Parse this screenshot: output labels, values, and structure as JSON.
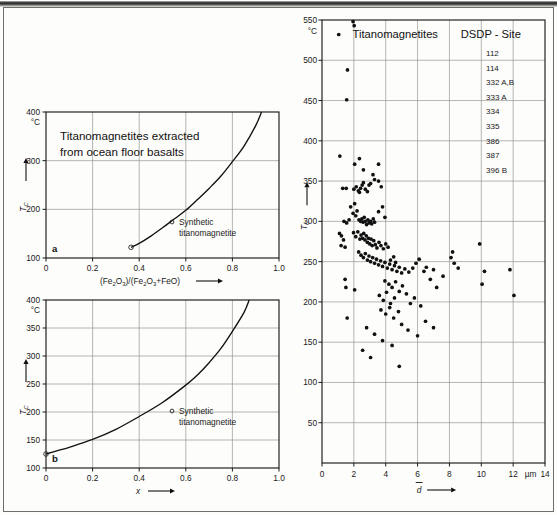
{
  "figure": {
    "background": "#fdfdfb",
    "ink": "#111111",
    "grid_color": "#8e8e8a"
  },
  "panel_a": {
    "label": "a",
    "title_line1": "Titanomagnetites extracted",
    "title_line2": "from ocean floor basalts",
    "ylabel_symbol": "T",
    "ylabel_sub": "C",
    "yunit": "°C",
    "xlabel": "(Fe₂O₃)/(Fe₂O₃+FeO)",
    "legend_marker": "open-circle",
    "legend_line1": "Synthetic",
    "legend_line2": "titanomagnetite",
    "xticks": [
      "0",
      "0.2",
      "0.4",
      "0.6",
      "0.8",
      "1.0"
    ],
    "yticks": [
      "100",
      "200",
      "300",
      "400"
    ]
  },
  "panel_b": {
    "label": "b",
    "ylabel_symbol": "T",
    "ylabel_sub": "C",
    "yunit": "°C",
    "xlabel": "x",
    "legend_marker": "open-circle",
    "legend_line1": "Synthetic",
    "legend_line2": "titanomagnetite",
    "xticks": [
      "0",
      "0.2",
      "0.4",
      "0.6",
      "0.8",
      "1.0"
    ],
    "yticks": [
      "100",
      "150",
      "200",
      "250",
      "300",
      "350",
      "400"
    ]
  },
  "panel_c": {
    "title": "Titanomagnetites",
    "legend_title": "DSDP - Site",
    "sites": [
      "112",
      "114",
      "332 A,B",
      "333 A",
      "334",
      "335",
      "386",
      "387",
      "396 B"
    ],
    "ylabel_symbol": "T",
    "ylabel_sub": "C",
    "yunit": "°C",
    "xlabel": "d",
    "xunit": "µm",
    "xticks": [
      "0",
      "2",
      "4",
      "6",
      "8",
      "10",
      "12",
      "14"
    ],
    "yticks": [
      "50",
      "100",
      "150",
      "200",
      "250",
      "300",
      "350",
      "400",
      "450",
      "500",
      "550"
    ]
  },
  "chart_data": [
    {
      "type": "line",
      "panel": "a",
      "title": "Titanomagnetites extracted from ocean floor basalts",
      "xlabel": "(Fe2O3)/(Fe2O3+FeO)",
      "ylabel": "Tc (°C)",
      "xlim": [
        0,
        1.0
      ],
      "ylim": [
        100,
        400
      ],
      "grid": true,
      "series": [
        {
          "name": "Synthetic titanomagnetite",
          "marker": "open-circle-start",
          "x": [
            0.365,
            0.4,
            0.45,
            0.5,
            0.55,
            0.6,
            0.65,
            0.7,
            0.75,
            0.8,
            0.85,
            0.9,
            0.925
          ],
          "y": [
            122,
            130,
            145,
            162,
            180,
            198,
            220,
            243,
            268,
            298,
            330,
            372,
            400
          ]
        }
      ]
    },
    {
      "type": "line",
      "panel": "b",
      "xlabel": "x",
      "ylabel": "Tc (°C)",
      "xlim": [
        0,
        1.0
      ],
      "ylim": [
        100,
        400
      ],
      "grid": true,
      "series": [
        {
          "name": "Synthetic titanomagnetite",
          "marker": "open-circle-start",
          "x": [
            0.0,
            0.05,
            0.1,
            0.2,
            0.3,
            0.4,
            0.5,
            0.6,
            0.65,
            0.7,
            0.75,
            0.8,
            0.85,
            0.872
          ],
          "y": [
            125,
            131,
            137,
            151,
            169,
            192,
            217,
            248,
            266,
            288,
            313,
            344,
            378,
            400
          ]
        }
      ]
    },
    {
      "type": "scatter",
      "panel": "c",
      "title": "Titanomagnetites",
      "legend_title": "DSDP - Site",
      "xlabel": "d (µm)",
      "ylabel": "Tc (°C)",
      "xlim": [
        0,
        14
      ],
      "ylim": [
        0,
        550
      ],
      "grid": true,
      "points": [
        [
          1.05,
          532
        ],
        [
          1.95,
          548
        ],
        [
          2.02,
          543
        ],
        [
          1.6,
          488
        ],
        [
          1.55,
          451
        ],
        [
          1.12,
          381
        ],
        [
          2.05,
          371
        ],
        [
          2.35,
          378
        ],
        [
          2.6,
          364
        ],
        [
          3.2,
          358
        ],
        [
          3.55,
          371
        ],
        [
          1.3,
          341
        ],
        [
          1.52,
          341
        ],
        [
          2.0,
          340
        ],
        [
          2.15,
          343
        ],
        [
          2.28,
          338
        ],
        [
          2.35,
          336
        ],
        [
          2.42,
          341
        ],
        [
          2.52,
          345
        ],
        [
          2.6,
          348
        ],
        [
          2.72,
          340
        ],
        [
          2.85,
          337
        ],
        [
          2.95,
          345
        ],
        [
          3.05,
          347
        ],
        [
          3.3,
          352
        ],
        [
          3.55,
          350
        ],
        [
          3.72,
          343
        ],
        [
          1.8,
          318
        ],
        [
          2.05,
          322
        ],
        [
          1.95,
          310
        ],
        [
          2.12,
          307
        ],
        [
          2.2,
          313
        ],
        [
          2.32,
          302
        ],
        [
          2.42,
          300
        ],
        [
          2.5,
          303
        ],
        [
          2.58,
          299
        ],
        [
          2.65,
          305
        ],
        [
          2.72,
          300
        ],
        [
          2.8,
          296
        ],
        [
          2.88,
          302
        ],
        [
          2.95,
          298
        ],
        [
          3.05,
          300
        ],
        [
          3.12,
          297
        ],
        [
          3.22,
          303
        ],
        [
          3.3,
          299
        ],
        [
          1.38,
          300
        ],
        [
          1.55,
          298
        ],
        [
          1.7,
          302
        ],
        [
          3.55,
          312
        ],
        [
          3.8,
          318
        ],
        [
          3.95,
          305
        ],
        [
          1.1,
          285
        ],
        [
          1.22,
          282
        ],
        [
          1.35,
          277
        ],
        [
          1.2,
          270
        ],
        [
          1.45,
          268
        ],
        [
          1.98,
          286
        ],
        [
          2.12,
          281
        ],
        [
          2.25,
          287
        ],
        [
          2.38,
          278
        ],
        [
          2.45,
          283
        ],
        [
          2.55,
          279
        ],
        [
          2.62,
          285
        ],
        [
          2.7,
          277
        ],
        [
          2.78,
          282
        ],
        [
          2.85,
          274
        ],
        [
          2.92,
          279
        ],
        [
          3.0,
          272
        ],
        [
          3.08,
          278
        ],
        [
          3.15,
          270
        ],
        [
          3.25,
          276
        ],
        [
          3.35,
          271
        ],
        [
          3.45,
          267
        ],
        [
          3.58,
          274
        ],
        [
          3.7,
          270
        ],
        [
          3.85,
          266
        ],
        [
          4.0,
          272
        ],
        [
          4.15,
          268
        ],
        [
          2.3,
          262
        ],
        [
          2.45,
          258
        ],
        [
          2.6,
          255
        ],
        [
          2.72,
          260
        ],
        [
          2.85,
          252
        ],
        [
          2.95,
          257
        ],
        [
          3.05,
          250
        ],
        [
          3.18,
          255
        ],
        [
          3.3,
          248
        ],
        [
          3.42,
          253
        ],
        [
          3.55,
          246
        ],
        [
          3.68,
          251
        ],
        [
          3.8,
          244
        ],
        [
          3.95,
          249
        ],
        [
          4.1,
          242
        ],
        [
          4.25,
          247
        ],
        [
          4.4,
          240
        ],
        [
          4.55,
          245
        ],
        [
          4.7,
          238
        ],
        [
          4.85,
          243
        ],
        [
          5.0,
          236
        ],
        [
          5.2,
          241
        ],
        [
          5.45,
          237
        ],
        [
          5.7,
          242
        ],
        [
          1.45,
          228
        ],
        [
          1.5,
          218
        ],
        [
          2.05,
          215
        ],
        [
          1.58,
          180
        ],
        [
          4.3,
          252
        ],
        [
          4.5,
          256
        ],
        [
          4.62,
          249
        ],
        [
          5.9,
          248
        ],
        [
          6.1,
          253
        ],
        [
          6.4,
          238
        ],
        [
          6.55,
          243
        ],
        [
          7.0,
          240
        ],
        [
          3.95,
          226
        ],
        [
          4.2,
          222
        ],
        [
          4.4,
          218
        ],
        [
          4.62,
          225
        ],
        [
          4.85,
          213
        ],
        [
          5.05,
          220
        ],
        [
          3.6,
          208
        ],
        [
          3.85,
          202
        ],
        [
          4.05,
          212
        ],
        [
          4.3,
          198
        ],
        [
          4.55,
          205
        ],
        [
          3.7,
          190
        ],
        [
          4.0,
          185
        ],
        [
          4.25,
          193
        ],
        [
          4.5,
          180
        ],
        [
          4.8,
          188
        ],
        [
          5.3,
          210
        ],
        [
          5.55,
          198
        ],
        [
          5.8,
          205
        ],
        [
          6.2,
          195
        ],
        [
          6.8,
          228
        ],
        [
          7.2,
          218
        ],
        [
          7.6,
          232
        ],
        [
          8.1,
          255
        ],
        [
          8.3,
          248
        ],
        [
          8.55,
          242
        ],
        [
          8.2,
          262
        ],
        [
          9.9,
          272
        ],
        [
          10.2,
          238
        ],
        [
          10.05,
          222
        ],
        [
          11.8,
          240
        ],
        [
          12.05,
          208
        ],
        [
          2.8,
          168
        ],
        [
          3.3,
          160
        ],
        [
          3.8,
          152
        ],
        [
          4.4,
          146
        ],
        [
          3.05,
          131
        ],
        [
          4.85,
          120
        ],
        [
          2.55,
          140
        ],
        [
          5.0,
          172
        ],
        [
          5.4,
          165
        ],
        [
          6.0,
          158
        ],
        [
          6.5,
          176
        ],
        [
          7.0,
          168
        ]
      ]
    }
  ]
}
